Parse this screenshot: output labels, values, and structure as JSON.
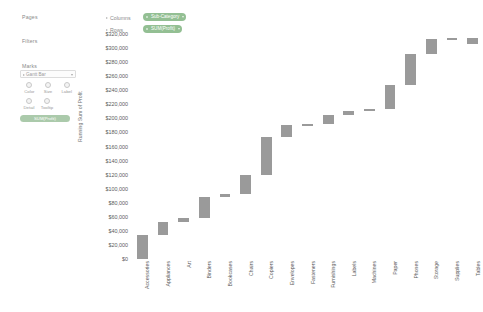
{
  "app": {
    "shelves": {
      "pages_label": "Pages",
      "filters_label": "Filters",
      "marks_label": "Marks",
      "columns_label": "Columns",
      "rows_label": "Rows",
      "columns_pill": "Sub-Category",
      "rows_pill": "SUM(Profit)"
    },
    "marks_card": {
      "mark_type": "Gantt Bar",
      "buttons": [
        "Color",
        "Size",
        "Label",
        "Detail",
        "Tooltip"
      ],
      "tooltip_button": "SUM(Profit)"
    },
    "colors": {
      "bar": "#9a9a9a",
      "pill": "#93bf93",
      "axis_text": "#5c5c5c"
    },
    "icons": {
      "columns_expand": "chevron-right-icon",
      "rows_expand": "chevron-right-icon",
      "pill_dropdown": "chevron-down-icon",
      "marktype_dropdown": "chevron-down-icon"
    }
  },
  "chart_data": {
    "type": "bar",
    "subtype": "waterfall",
    "title": "",
    "xlabel": "",
    "ylabel": "Running Sum of Profit",
    "ylim": [
      0,
      320000
    ],
    "ytick_step": 20000,
    "grid": false,
    "legend": null,
    "yticks": [
      "$320,000",
      "$300,000",
      "$280,000",
      "$260,000",
      "$240,000",
      "$220,000",
      "$200,000",
      "$180,000",
      "$160,000",
      "$140,000",
      "$120,000",
      "$100,000",
      "$80,000",
      "$60,000",
      "$40,000",
      "$20,000",
      "$0"
    ],
    "ytick_values": [
      320000,
      300000,
      280000,
      260000,
      240000,
      220000,
      200000,
      180000,
      160000,
      140000,
      120000,
      100000,
      80000,
      60000,
      40000,
      20000,
      0
    ],
    "categories": [
      "Accessories",
      "Appliances",
      "Art",
      "Binders",
      "Bookcases",
      "Chairs",
      "Copiers",
      "Envelopes",
      "Fasteners",
      "Furnishings",
      "Labels",
      "Machines",
      "Paper",
      "Phones",
      "Storage",
      "Supplies",
      "Tables"
    ],
    "values": [
      34000,
      18000,
      6500,
      30000,
      3500,
      27000,
      55000,
      17000,
      1000,
      13000,
      5500,
      3500,
      34000,
      44000,
      21000,
      1000,
      -8000
    ],
    "running_start": [
      0,
      34000,
      52000,
      58500,
      88500,
      92000,
      119000,
      174000,
      191000,
      192000,
      205000,
      210500,
      214000,
      248000,
      292000,
      313000,
      314000
    ],
    "running_end": [
      34000,
      52000,
      58500,
      88500,
      92000,
      119000,
      174000,
      191000,
      192000,
      205000,
      210500,
      214000,
      248000,
      292000,
      313000,
      314000,
      306000
    ]
  }
}
